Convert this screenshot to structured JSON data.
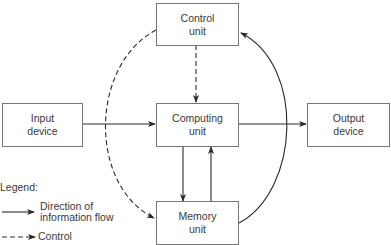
{
  "diagram": {
    "title": "",
    "nodes": [
      {
        "id": "control",
        "line1": "Control",
        "line2": "unit"
      },
      {
        "id": "input",
        "line1": "Input",
        "line2": "device"
      },
      {
        "id": "computing",
        "line1": "Computing",
        "line2": "unit"
      },
      {
        "id": "output",
        "line1": "Output",
        "line2": "device"
      },
      {
        "id": "memory",
        "line1": "Memory",
        "line2": "unit"
      }
    ],
    "edges": [
      {
        "from": "input",
        "to": "computing",
        "style": "solid"
      },
      {
        "from": "computing",
        "to": "output",
        "style": "solid"
      },
      {
        "from": "computing",
        "to": "memory",
        "style": "solid"
      },
      {
        "from": "memory",
        "to": "computing",
        "style": "solid"
      },
      {
        "from": "memory",
        "to": "control",
        "style": "solid"
      },
      {
        "from": "control",
        "to": "computing",
        "style": "dashed"
      },
      {
        "from": "control",
        "to": "memory",
        "style": "dashed"
      }
    ],
    "legend": {
      "title": "Legend:",
      "solid_line1": "Direction of",
      "solid_line2": "information flow",
      "dashed_label": "Control"
    },
    "colors": {
      "line": "#2a2a2a",
      "box_border": "#777777"
    }
  }
}
